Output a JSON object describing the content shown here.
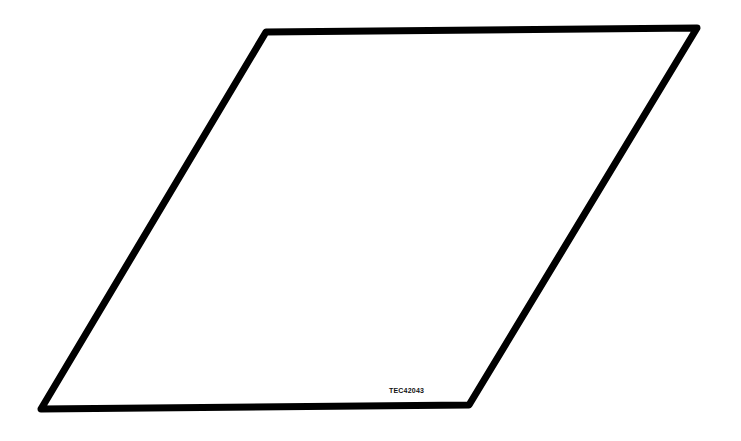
{
  "diagram": {
    "shape": "parallelogram",
    "stroke_color": "#000000",
    "fill_color": "#ffffff",
    "stroke_width": 7,
    "points": [
      [
        266,
        32
      ],
      [
        697,
        28
      ],
      [
        469,
        405
      ],
      [
        41,
        409
      ]
    ],
    "label": "TEC42043"
  }
}
